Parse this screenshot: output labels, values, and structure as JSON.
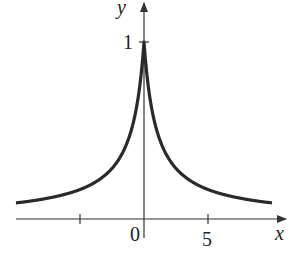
{
  "chart_data": {
    "type": "line",
    "title": "",
    "xlabel": "x",
    "ylabel": "y",
    "function": "y = 1/(1+|x|)",
    "x_ticks": [
      -5,
      0,
      5
    ],
    "x_tick_labels": [
      "",
      "0",
      "5"
    ],
    "y_tick_labels": [
      "1"
    ],
    "xlim": [
      -10,
      10.5
    ],
    "ylim": [
      0,
      1.05
    ],
    "grid": false,
    "series": [
      {
        "name": "curve",
        "x": [
          -10,
          -8,
          -6,
          -5,
          -4,
          -3,
          -2,
          -1,
          -0.5,
          0,
          0.5,
          1,
          2,
          3,
          4,
          5,
          6,
          8,
          10
        ],
        "values": [
          0.091,
          0.111,
          0.143,
          0.167,
          0.2,
          0.25,
          0.333,
          0.5,
          0.667,
          1,
          0.667,
          0.5,
          0.333,
          0.25,
          0.2,
          0.167,
          0.143,
          0.111,
          0.091
        ]
      }
    ],
    "annotations": [
      "peak at (0, 1)"
    ]
  },
  "labels": {
    "x_axis": "x",
    "y_axis": "y",
    "origin": "0",
    "x_tick_5": "5",
    "y_tick_1": "1"
  },
  "colors": {
    "curve": "#2a2a2a",
    "axis": "#333333"
  }
}
